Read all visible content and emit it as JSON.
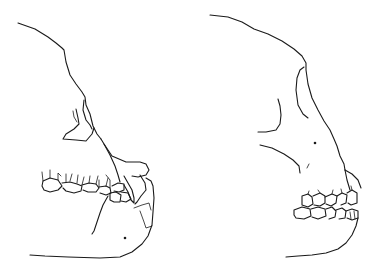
{
  "figure": {
    "panels": [
      {
        "id": "left",
        "subject": "skull-lateral-view-prognathic-jaw-with-large-canine"
      },
      {
        "id": "right",
        "subject": "skull-lateral-view-high-forehead-with-teeth"
      }
    ],
    "colors": {
      "background": "#ffffff",
      "line": "#1a1a1a"
    }
  }
}
